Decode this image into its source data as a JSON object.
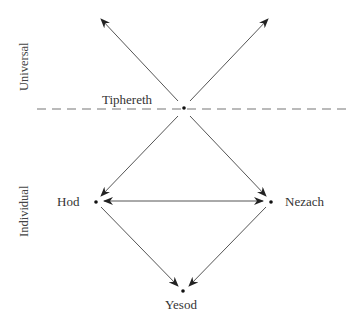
{
  "diagram": {
    "type": "directed-graph",
    "side_labels": {
      "upper": "Universal",
      "lower": "Individual"
    },
    "nodes": [
      {
        "id": "tiphereth",
        "label": "Tiphereth"
      },
      {
        "id": "hod",
        "label": "Hod"
      },
      {
        "id": "nezach",
        "label": "Nezach"
      },
      {
        "id": "yesod",
        "label": "Yesod"
      }
    ],
    "edges": [
      {
        "from": "tiphereth",
        "to": "upper-left",
        "style": "arrow"
      },
      {
        "from": "tiphereth",
        "to": "upper-right",
        "style": "arrow"
      },
      {
        "from": "tiphereth",
        "to": "hod",
        "style": "arrow"
      },
      {
        "from": "tiphereth",
        "to": "nezach",
        "style": "arrow"
      },
      {
        "from": "hod",
        "to": "nezach",
        "style": "double-arrow"
      },
      {
        "from": "hod",
        "to": "yesod",
        "style": "arrow"
      },
      {
        "from": "nezach",
        "to": "yesod",
        "style": "arrow"
      }
    ],
    "divider": "dashed horizontal line through Tiphereth separating Universal and Individual",
    "colors": {
      "line": "#555555",
      "text": "#333333",
      "dot": "#111111"
    }
  }
}
